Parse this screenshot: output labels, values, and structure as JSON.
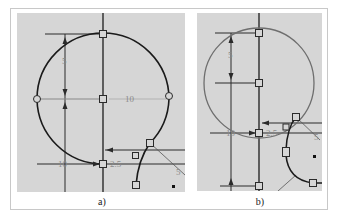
{
  "figure": {
    "panels": [
      {
        "id": "a",
        "caption": "a)",
        "dimensions": {
          "vertical_radius": "5",
          "horizontal_radius": "10",
          "left_offset": "10",
          "small_offset": "2.5",
          "slanted": "5"
        },
        "circle_color": "#1a1a1a"
      },
      {
        "id": "b",
        "caption": "b)",
        "dimensions": {
          "vertical_radius": "5",
          "left_offset": "10",
          "small_offset": "2.5",
          "slanted": "5"
        },
        "circle_color": "#6e6e6e"
      }
    ],
    "colors": {
      "background": "#ffffff",
      "panel_fill": "#d6d6d6",
      "geometry": "#1a1a1a",
      "construction": "#2a2a2a",
      "dimension_text": "#8a8a8a"
    }
  }
}
